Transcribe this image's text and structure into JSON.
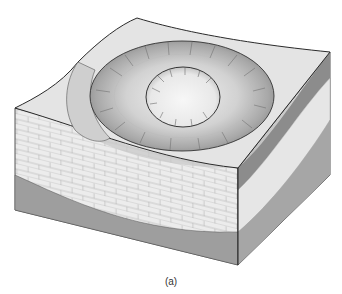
{
  "figure": {
    "caption": "(a)",
    "colors": {
      "background": "#ffffff",
      "surface": "#e4e4e4",
      "crater_rim": "#bdbdbd",
      "crater_floor": "#d6d6d6",
      "inner_crater": "#f0f0f0",
      "limestone_layer": "#ececec",
      "dark_layer": "#8c8c8c",
      "bottom_layer": "#9e9e9e",
      "outline": "#2a2a2a"
    },
    "layers": [
      {
        "name": "surface-sediment"
      },
      {
        "name": "dark-shale-layer"
      },
      {
        "name": "limestone-layer"
      },
      {
        "name": "basement-layer"
      }
    ]
  }
}
